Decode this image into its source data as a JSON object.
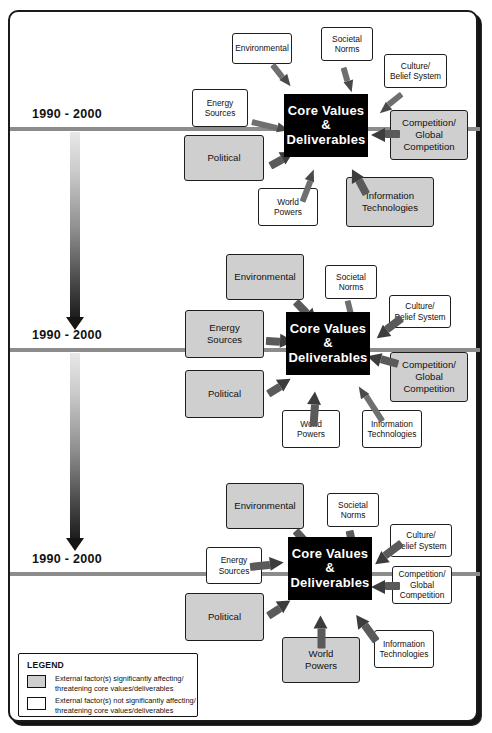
{
  "diagram": {
    "core_label_line1": "Core Values",
    "core_label_line2": "&",
    "core_label_line3": "Deliverables",
    "timeline_label": "1990 - 2000",
    "colors": {
      "affecting_fill": "#cfcfcf",
      "not_affecting_fill": "#ffffff",
      "core_fill": "#000000",
      "timeline": "#8c8c8c",
      "arrow": "#6b6b6b",
      "border": "#1e1e1e"
    }
  },
  "legend": {
    "title": "LEGEND",
    "items": [
      {
        "swatch": "gray",
        "text": "External factor(s) significantly affecting/\nthreatening core values/deliverables"
      },
      {
        "swatch": "white",
        "text": "External factor(s) not significantly affecting/\nthreatening core values/deliverables"
      }
    ]
  },
  "panels": [
    {
      "id": "panel-1",
      "timeline_label": "1990 - 2000",
      "factors": [
        {
          "name": "environmental",
          "label": "Environmental",
          "state": "not-affecting",
          "size": "small"
        },
        {
          "name": "societal-norms",
          "label": "Societal\nNorms",
          "state": "not-affecting",
          "size": "small"
        },
        {
          "name": "culture-belief-system",
          "label": "Culture/\nBelief System",
          "state": "not-affecting",
          "size": "small"
        },
        {
          "name": "energy-sources",
          "label": "Energy\nSources",
          "state": "not-affecting",
          "size": "small"
        },
        {
          "name": "competition-global-competition",
          "label": "Competition/\nGlobal\nCompetition",
          "state": "affecting",
          "size": "big"
        },
        {
          "name": "political",
          "label": "Political",
          "state": "affecting",
          "size": "big"
        },
        {
          "name": "world-powers",
          "label": "World\nPowers",
          "state": "not-affecting",
          "size": "small"
        },
        {
          "name": "information-technologies",
          "label": "Information\nTechnologies",
          "state": "affecting",
          "size": "big"
        }
      ]
    },
    {
      "id": "panel-2",
      "timeline_label": "1990 - 2000",
      "factors": [
        {
          "name": "environmental",
          "label": "Environmental",
          "state": "affecting",
          "size": "big"
        },
        {
          "name": "societal-norms",
          "label": "Societal\nNorms",
          "state": "not-affecting",
          "size": "small"
        },
        {
          "name": "culture-belief-system",
          "label": "Culture/\nBelief System",
          "state": "not-affecting",
          "size": "small"
        },
        {
          "name": "energy-sources",
          "label": "Energy\nSources",
          "state": "affecting",
          "size": "big"
        },
        {
          "name": "competition-global-competition",
          "label": "Competition/\nGlobal\nCompetition",
          "state": "affecting",
          "size": "big"
        },
        {
          "name": "political",
          "label": "Political",
          "state": "affecting",
          "size": "big"
        },
        {
          "name": "world-powers",
          "label": "World\nPowers",
          "state": "not-affecting",
          "size": "small"
        },
        {
          "name": "information-technologies",
          "label": "Information\nTechnologies",
          "state": "not-affecting",
          "size": "small"
        }
      ]
    },
    {
      "id": "panel-3",
      "timeline_label": "1990 - 2000",
      "factors": [
        {
          "name": "environmental",
          "label": "Environmental",
          "state": "affecting",
          "size": "big"
        },
        {
          "name": "societal-norms",
          "label": "Societal\nNorms",
          "state": "not-affecting",
          "size": "small"
        },
        {
          "name": "culture-belief-system",
          "label": "Culture/\nBelief System",
          "state": "not-affecting",
          "size": "small"
        },
        {
          "name": "energy-sources",
          "label": "Energy\nSources",
          "state": "not-affecting",
          "size": "small"
        },
        {
          "name": "competition-global-competition",
          "label": "Competition/\nGlobal\nCompetition",
          "state": "not-affecting",
          "size": "small"
        },
        {
          "name": "political",
          "label": "Political",
          "state": "affecting",
          "size": "big"
        },
        {
          "name": "world-powers",
          "label": "World\nPowers",
          "state": "affecting",
          "size": "big"
        },
        {
          "name": "information-technologies",
          "label": "Information\nTechnologies",
          "state": "not-affecting",
          "size": "small"
        }
      ]
    }
  ]
}
